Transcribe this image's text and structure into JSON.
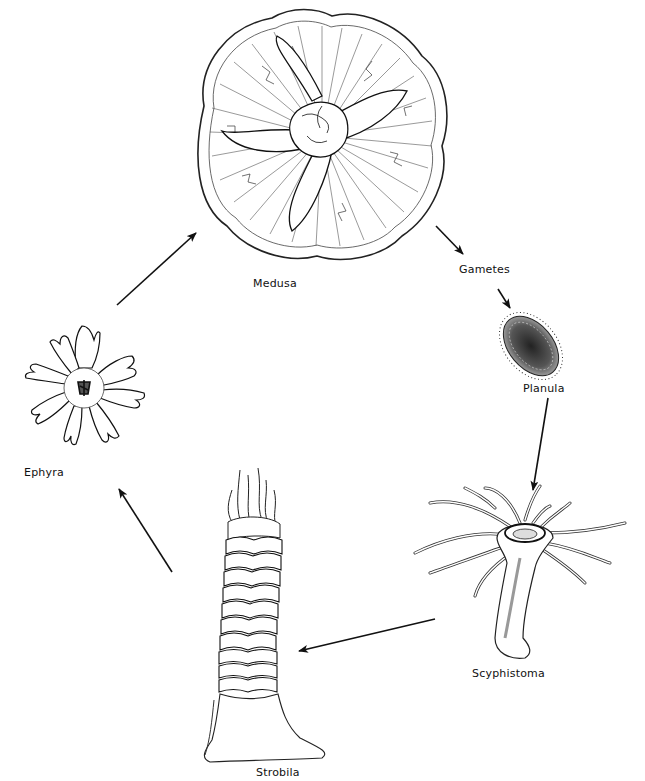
{
  "diagram": {
    "type": "life-cycle",
    "stages": [
      {
        "id": "medusa",
        "label": "Medusa"
      },
      {
        "id": "gametes",
        "label": "Gametes"
      },
      {
        "id": "planula",
        "label": "Planula"
      },
      {
        "id": "scyphistoma",
        "label": "Scyphistoma"
      },
      {
        "id": "strobila",
        "label": "Strobila"
      },
      {
        "id": "ephyra",
        "label": "Ephyra"
      }
    ],
    "edges": [
      {
        "from": "medusa",
        "to": "gametes"
      },
      {
        "from": "gametes",
        "to": "planula"
      },
      {
        "from": "planula",
        "to": "scyphistoma"
      },
      {
        "from": "scyphistoma",
        "to": "strobila"
      },
      {
        "from": "strobila",
        "to": "ephyra"
      },
      {
        "from": "ephyra",
        "to": "medusa"
      }
    ],
    "colors": {
      "ink": "#111111",
      "background": "#ffffff"
    }
  }
}
